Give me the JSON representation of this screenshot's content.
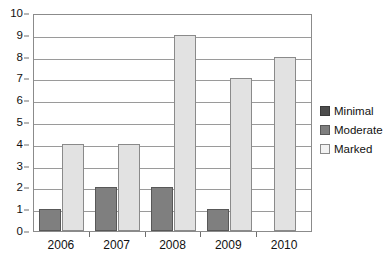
{
  "chart_data": {
    "type": "bar",
    "title": "",
    "subtitle": "",
    "xlabel": "",
    "ylabel": "",
    "categories": [
      "2006",
      "2007",
      "2008",
      "2009",
      "2010"
    ],
    "series": [
      {
        "name": "Minimal",
        "color": "#4d4d4d",
        "values": [
          0,
          0,
          0,
          0,
          0
        ]
      },
      {
        "name": "Moderate",
        "color": "#7f7f7f",
        "values": [
          1,
          2,
          2,
          1,
          0
        ]
      },
      {
        "name": "Marked",
        "color": "#e2e2e2",
        "values": [
          4,
          4,
          9,
          7,
          8
        ]
      }
    ],
    "ylim": [
      0,
      10
    ],
    "ytick_step": 1,
    "yticks": [
      "10",
      "9",
      "8",
      "7",
      "6",
      "5",
      "4",
      "3",
      "2",
      "1",
      "0"
    ],
    "grid": true,
    "grid_axis": "y",
    "legend_position": "right",
    "legend": [
      "Minimal",
      "Moderate",
      "Marked"
    ],
    "annotations": []
  },
  "colors": {
    "background": "#ffffff",
    "axis": "#8b8b8b",
    "gridline": "#9a9a9a",
    "text": "#111111"
  }
}
